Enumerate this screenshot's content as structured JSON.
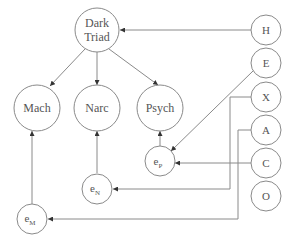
{
  "diagram": {
    "type": "structural-path-model",
    "colors": {
      "stroke": "#8a8a8a",
      "text": "#555555",
      "background": "#ffffff"
    },
    "nodes": {
      "dark_triad": {
        "line1": "Dark",
        "line2": "Triad"
      },
      "mach": {
        "label": "Mach"
      },
      "narc": {
        "label": "Narc"
      },
      "psych": {
        "label": "Psych"
      },
      "e_p": {
        "base": "e",
        "sub": "P"
      },
      "e_n": {
        "base": "e",
        "sub": "N"
      },
      "e_m": {
        "base": "e",
        "sub": "M"
      },
      "h": {
        "label": "H"
      },
      "e": {
        "label": "E"
      },
      "x": {
        "label": "X"
      },
      "a": {
        "label": "A"
      },
      "c": {
        "label": "C"
      },
      "o": {
        "label": "O"
      }
    },
    "edges": [
      {
        "from": "H",
        "to": "Dark Triad"
      },
      {
        "from": "Dark Triad",
        "to": "Mach"
      },
      {
        "from": "Dark Triad",
        "to": "Narc"
      },
      {
        "from": "Dark Triad",
        "to": "Psych"
      },
      {
        "from": "E",
        "to": "e_P"
      },
      {
        "from": "C",
        "to": "e_P"
      },
      {
        "from": "X",
        "to": "e_N"
      },
      {
        "from": "A",
        "to": "e_M"
      },
      {
        "from": "e_P",
        "to": "Psych"
      },
      {
        "from": "e_N",
        "to": "Narc"
      },
      {
        "from": "e_M",
        "to": "Mach"
      }
    ]
  }
}
